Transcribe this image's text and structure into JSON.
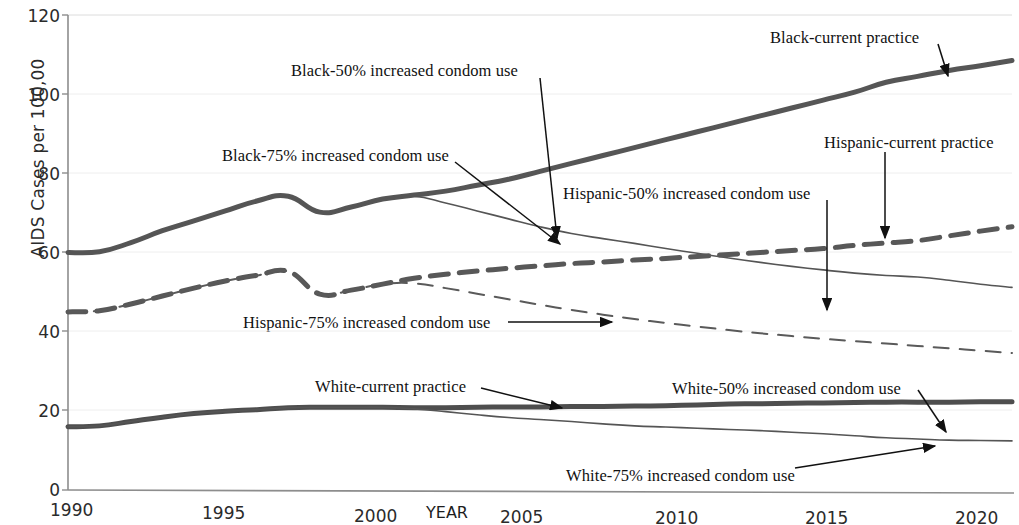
{
  "chart_data": {
    "type": "line",
    "title": "",
    "xlabel": "YEAR",
    "ylabel": "AIDS Cases per 100,00",
    "xlim": [
      1990,
      2020
    ],
    "ylim": [
      0,
      120
    ],
    "grid": true,
    "legend_position": "inline-annotations",
    "xticks": [
      "1990",
      "1995",
      "2000",
      "2005",
      "2010",
      "2015",
      "2020"
    ],
    "yticks": [
      "0",
      "20",
      "40",
      "60",
      "80",
      "100",
      "120"
    ],
    "x": [
      1990,
      1991,
      1992,
      1993,
      1994,
      1995,
      1996,
      1997,
      1998,
      1999,
      2000,
      2001,
      2002,
      2003,
      2004,
      2005,
      2006,
      2007,
      2008,
      2009,
      2010,
      2011,
      2012,
      2013,
      2014,
      2015,
      2016,
      2017,
      2018,
      2019,
      2020
    ],
    "series": [
      {
        "name": "Black-current practice",
        "style": "thick-solid",
        "color": "#565656",
        "values": [
          60.0,
          60.2,
          62.5,
          65.5,
          68.0,
          70.5,
          73.0,
          74.2,
          70.2,
          71.5,
          73.5,
          74.5,
          75.5,
          77.0,
          78.5,
          80.5,
          82.5,
          84.5,
          86.5,
          88.5,
          90.5,
          92.5,
          94.5,
          96.5,
          98.5,
          100.5,
          103.0,
          104.5,
          106.0,
          107.2,
          108.5
        ]
      },
      {
        "name": "Black-75% increased condom use",
        "style": "thin-solid",
        "color": "#555555",
        "values": [
          60.0,
          60.2,
          62.5,
          65.5,
          68.0,
          70.5,
          73.0,
          74.2,
          70.2,
          71.5,
          73.5,
          74.2,
          72.5,
          70.5,
          68.5,
          66.5,
          64.8,
          63.5,
          62.3,
          61.0,
          59.8,
          58.6,
          57.5,
          56.5,
          55.6,
          54.8,
          54.2,
          53.8,
          53.0,
          52.0,
          51.2
        ]
      },
      {
        "name": "Hispanic-current practice",
        "style": "thick-dashed",
        "color": "#585858",
        "values": [
          45.0,
          45.3,
          47.0,
          49.0,
          51.0,
          52.8,
          54.2,
          55.2,
          49.5,
          50.5,
          52.0,
          53.5,
          54.5,
          55.3,
          56.0,
          56.6,
          57.2,
          57.6,
          58.1,
          58.5,
          59.0,
          59.5,
          60.0,
          60.5,
          61.0,
          61.8,
          62.4,
          63.0,
          64.2,
          65.4,
          66.5
        ]
      },
      {
        "name": "Hispanic-75% increased condom use",
        "style": "thin-dashed",
        "color": "#5a5a5a",
        "values": [
          45.0,
          45.3,
          47.0,
          49.0,
          51.0,
          52.8,
          54.2,
          55.2,
          49.5,
          50.5,
          52.0,
          52.2,
          51.0,
          49.6,
          48.2,
          46.8,
          45.5,
          44.3,
          43.2,
          42.2,
          41.3,
          40.4,
          39.6,
          38.9,
          38.2,
          37.6,
          37.0,
          36.4,
          35.8,
          35.2,
          34.6
        ]
      },
      {
        "name": "White-current practice",
        "style": "thick-solid",
        "color": "#4e4e4e",
        "values": [
          16.0,
          16.2,
          17.3,
          18.4,
          19.3,
          19.9,
          20.3,
          20.8,
          20.9,
          20.9,
          20.9,
          20.8,
          20.8,
          20.9,
          21.0,
          21.0,
          21.1,
          21.1,
          21.2,
          21.3,
          21.5,
          21.7,
          21.8,
          21.9,
          22.0,
          22.1,
          22.2,
          22.2,
          22.2,
          22.3,
          22.3
        ]
      },
      {
        "name": "White-75% increased condom use",
        "style": "thin-solid",
        "color": "#555555",
        "values": [
          16.0,
          16.2,
          17.3,
          18.4,
          19.3,
          19.9,
          20.3,
          20.8,
          20.9,
          20.9,
          20.9,
          20.5,
          19.8,
          19.0,
          18.3,
          17.8,
          17.3,
          16.7,
          16.2,
          15.9,
          15.6,
          15.3,
          15.0,
          14.6,
          14.2,
          13.7,
          13.2,
          12.9,
          12.6,
          12.5,
          12.4
        ]
      }
    ],
    "annotations": [
      {
        "id": "black-current-practice",
        "text": "Black-current practice"
      },
      {
        "id": "black-50-increased-condom-use",
        "text": "Black-50% increased condom use"
      },
      {
        "id": "black-75-increased-condom-use",
        "text": "Black-75% increased condom use"
      },
      {
        "id": "hispanic-current-practice",
        "text": "Hispanic-current practice"
      },
      {
        "id": "hispanic-50-increased-condom-use",
        "text": "Hispanic-50% increased condom use"
      },
      {
        "id": "hispanic-75-increased-condom-use",
        "text": "Hispanic-75% increased condom use"
      },
      {
        "id": "white-current-practice",
        "text": "White-current practice"
      },
      {
        "id": "white-50-increased-condom-use",
        "text": "White-50% increased condom use"
      },
      {
        "id": "white-75-increased-condom-use",
        "text": "White-75% increased condom use"
      }
    ]
  },
  "axis": {
    "y_label": "AIDS Cases per 100,00",
    "x_label": "YEAR",
    "y_ticks": [
      "120",
      "100",
      "80",
      "60",
      "40",
      "20",
      "0"
    ],
    "x_ticks": [
      "1990",
      "1995",
      "2000",
      "2005",
      "2010",
      "2015",
      "2020"
    ]
  },
  "labels": {
    "black_current": "Black-current practice",
    "black_50": "Black-50% increased condom use",
    "black_75": "Black-75% increased condom use",
    "hispanic_current": "Hispanic-current practice",
    "hispanic_50": "Hispanic-50% increased condom use",
    "hispanic_75": "Hispanic-75% increased condom use",
    "white_current": "White-current practice",
    "white_50": "White-50% increased condom use",
    "white_75": "White-75% increased condom use"
  },
  "colors": {
    "line_dark": "#565656",
    "axis": "#8a8a8a",
    "grid": "#e8e8e8",
    "text": "#111111",
    "background": "#ffffff"
  }
}
